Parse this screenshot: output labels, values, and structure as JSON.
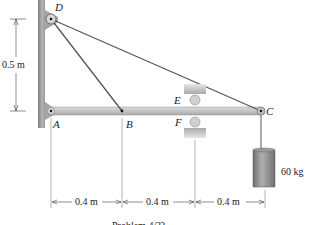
{
  "diagram": {
    "points": {
      "A": "A",
      "B": "B",
      "C": "C",
      "D": "D",
      "E": "E",
      "F": "F"
    },
    "dimensions": {
      "vertical": "0.5 m",
      "horizontal": [
        "0.4 m",
        "0.4 m",
        "0.4 m"
      ]
    },
    "mass_label": "60 kg",
    "caption": "Problem 4/??",
    "colors": {
      "wall": "#9a9a9a",
      "beam": "#c8c8c8",
      "cable": "#555555",
      "mass": "#8a8a8a"
    }
  }
}
